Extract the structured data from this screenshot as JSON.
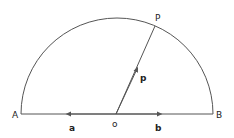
{
  "diagram": {
    "type": "semicircle-vectors",
    "points": {
      "A": "A",
      "B": "B",
      "O": "o",
      "P": "P"
    },
    "vectors": {
      "a": "a",
      "b": "b",
      "p": "p"
    },
    "colors": {
      "stroke": "#555555",
      "text": "#222222"
    }
  }
}
